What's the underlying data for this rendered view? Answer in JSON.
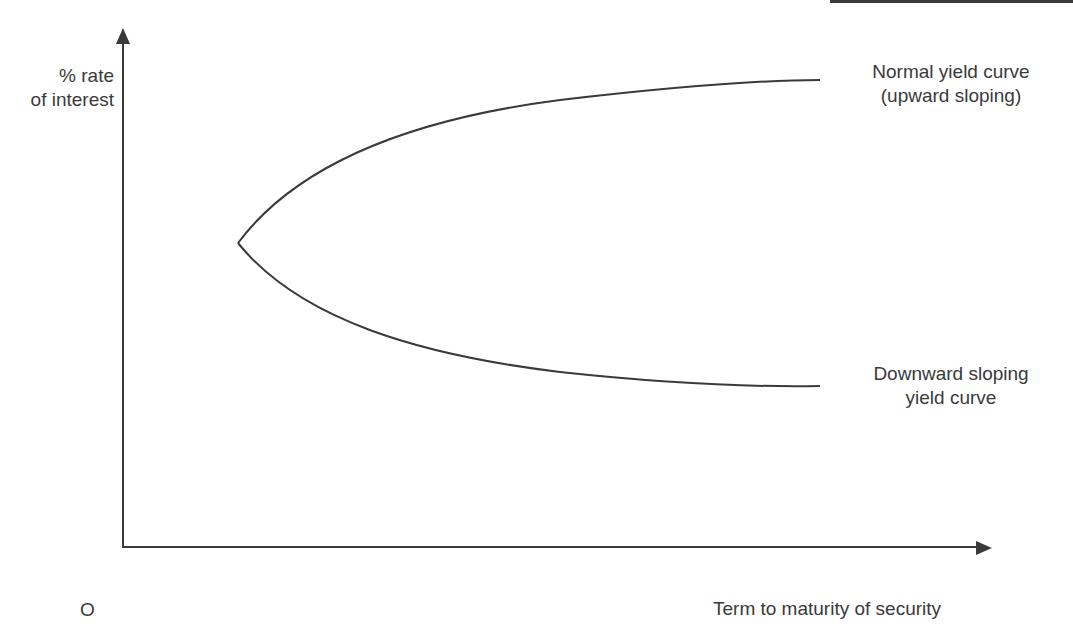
{
  "diagram": {
    "y_axis_label_line1": "% rate",
    "y_axis_label_line2": "of interest",
    "x_axis_label": "Term to maturity of security",
    "origin_label": "O",
    "curves": [
      {
        "name": "normal",
        "label_line1": "Normal yield curve",
        "label_line2": "(upward sloping)",
        "direction": "upward"
      },
      {
        "name": "downward",
        "label_line1": "Downward sloping",
        "label_line2": "yield curve",
        "direction": "downward"
      }
    ],
    "colors": {
      "line": "#3a3a3a",
      "text": "#3a3a3a",
      "background": "#ffffff"
    }
  }
}
